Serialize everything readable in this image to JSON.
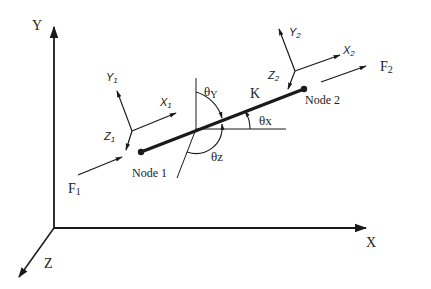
{
  "diagram": {
    "type": "beam element in 3D coordinate system",
    "global_axes": {
      "x_label": "X",
      "y_label": "Y",
      "z_label": "Z"
    },
    "element": {
      "stiffness_label": "K",
      "node1_label": "Node 1",
      "node2_label": "Node 2"
    },
    "local_frame_1": {
      "x_label": "X",
      "x_sub": "1",
      "y_label": "Y",
      "y_sub": "1",
      "z_label": "Z",
      "z_sub": "1"
    },
    "local_frame_2": {
      "x_label": "X",
      "x_sub": "2",
      "y_label": "Y",
      "y_sub": "2",
      "z_label": "Z",
      "z_sub": "2"
    },
    "forces": {
      "f1_label": "F",
      "f1_sub": "1",
      "f2_label": "F",
      "f2_sub": "2"
    },
    "angles": {
      "theta_y": "θY",
      "theta_x": "θx",
      "theta_z": "θz"
    },
    "colors": {
      "ink": "#1a1a1a",
      "background": "#ffffff"
    }
  }
}
